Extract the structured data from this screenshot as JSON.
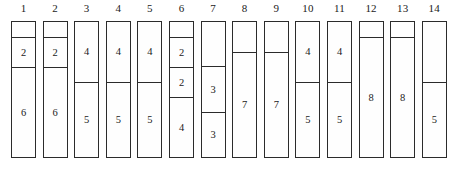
{
  "figure": {
    "width": 454,
    "height": 175,
    "background_color": "#ffffff",
    "line_color": "#2b2b2b",
    "text_color": "#1a1a1a"
  },
  "chart_data": {
    "type": "bar",
    "title": "",
    "subtitle": "",
    "xlabel": "",
    "ylabel": "",
    "grid": false,
    "legend": null,
    "bin_capacity": 8,
    "categories": [
      "1",
      "2",
      "3",
      "4",
      "5",
      "6",
      "7",
      "8",
      "9",
      "10",
      "11",
      "12",
      "13",
      "14"
    ],
    "values": [
      8,
      8,
      9,
      9,
      9,
      8,
      6,
      7,
      7,
      9,
      9,
      8,
      8,
      5
    ],
    "bins": [
      {
        "label": "1",
        "items": [
          {
            "value": "",
            "size": 1
          },
          {
            "value": "2",
            "size": 2
          },
          {
            "value": "6",
            "size": 6
          }
        ]
      },
      {
        "label": "2",
        "items": [
          {
            "value": "",
            "size": 1
          },
          {
            "value": "2",
            "size": 2
          },
          {
            "value": "6",
            "size": 6
          }
        ]
      },
      {
        "label": "3",
        "items": [
          {
            "value": "4",
            "size": 4
          },
          {
            "value": "5",
            "size": 5
          }
        ]
      },
      {
        "label": "4",
        "items": [
          {
            "value": "4",
            "size": 4
          },
          {
            "value": "5",
            "size": 5
          }
        ]
      },
      {
        "label": "5",
        "items": [
          {
            "value": "4",
            "size": 4
          },
          {
            "value": "5",
            "size": 5
          }
        ]
      },
      {
        "label": "6",
        "items": [
          {
            "value": "",
            "size": 1
          },
          {
            "value": "2",
            "size": 2
          },
          {
            "value": "2",
            "size": 2
          },
          {
            "value": "4",
            "size": 4
          }
        ]
      },
      {
        "label": "7",
        "items": [
          {
            "value": "",
            "size": 3
          },
          {
            "value": "3",
            "size": 3
          },
          {
            "value": "3",
            "size": 3
          }
        ]
      },
      {
        "label": "8",
        "items": [
          {
            "value": "",
            "size": 2
          },
          {
            "value": "7",
            "size": 7
          }
        ]
      },
      {
        "label": "9",
        "items": [
          {
            "value": "",
            "size": 2
          },
          {
            "value": "7",
            "size": 7
          }
        ]
      },
      {
        "label": "10",
        "items": [
          {
            "value": "4",
            "size": 4
          },
          {
            "value": "5",
            "size": 5
          }
        ]
      },
      {
        "label": "11",
        "items": [
          {
            "value": "4",
            "size": 4
          },
          {
            "value": "5",
            "size": 5
          }
        ]
      },
      {
        "label": "12",
        "items": [
          {
            "value": "",
            "size": 1
          },
          {
            "value": "8",
            "size": 8
          }
        ]
      },
      {
        "label": "13",
        "items": [
          {
            "value": "",
            "size": 1
          },
          {
            "value": "8",
            "size": 8
          }
        ]
      },
      {
        "label": "14",
        "items": [
          {
            "value": "",
            "size": 4
          },
          {
            "value": "5",
            "size": 5
          }
        ]
      }
    ]
  }
}
